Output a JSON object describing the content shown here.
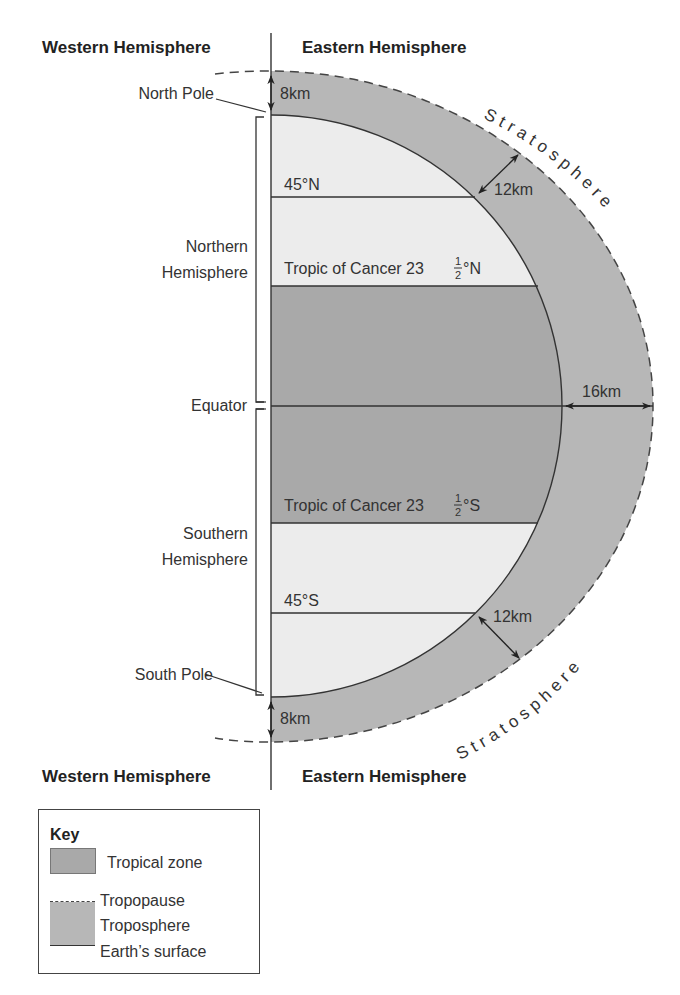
{
  "diagram": {
    "header": {
      "west_label": "Western Hemisphere",
      "east_label": "Eastern Hemisphere"
    },
    "footer": {
      "west_label": "Western Hemisphere",
      "east_label": "Eastern Hemisphere"
    },
    "left_labels": {
      "north_pole": "North Pole",
      "northern_hemisphere_line1": "Northern",
      "northern_hemisphere_line2": "Hemisphere",
      "equator": "Equator",
      "southern_hemisphere_line1": "Southern",
      "southern_hemisphere_line2": "Hemisphere",
      "south_pole": "South Pole"
    },
    "latitudes": {
      "n45": "45°N",
      "tropic_n_prefix": "Tropic of Cancer 23",
      "tropic_n_frac_num": "1",
      "tropic_n_frac_den": "2",
      "tropic_n_suffix": "°N",
      "tropic_s_prefix": "Tropic of Cancer 23",
      "tropic_s_frac_num": "1",
      "tropic_s_frac_den": "2",
      "tropic_s_suffix": "°S",
      "s45": "45°S"
    },
    "measurements": {
      "north_pole_thickness": "8km",
      "mid_north_thickness": "12km",
      "equator_thickness": "16km",
      "mid_south_thickness": "12km",
      "south_pole_thickness": "8km"
    },
    "stratosphere_label_north": "Stratosphere",
    "stratosphere_label_south": "Stratosphere",
    "colors": {
      "tropical_zone": "#a9a9a9",
      "troposphere": "#b7b7b7",
      "temperate_zone": "#ececec",
      "lines": "#333333"
    }
  },
  "key": {
    "title": "Key",
    "items": [
      {
        "label": "Tropical zone",
        "symbol": "dark-gray-swatch"
      },
      {
        "label": "Tropopause",
        "symbol": "dashed-line"
      },
      {
        "label": "Troposphere",
        "symbol": "gray-swatch"
      },
      {
        "label": "Earth’s surface",
        "symbol": "solid-line"
      }
    ]
  }
}
